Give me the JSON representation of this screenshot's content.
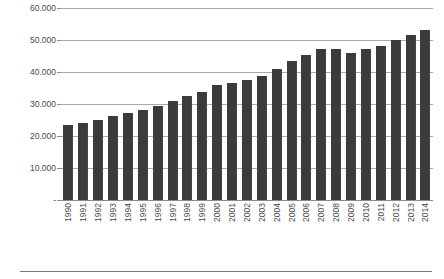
{
  "chart_data": {
    "type": "bar",
    "title": "",
    "subtitle": "",
    "xlabel": "",
    "ylabel": "em US$",
    "ylim": [
      0,
      60000
    ],
    "ytick_labels": [
      "60.000",
      "50.000",
      "40.000",
      "30.000",
      "20.000",
      "10.000",
      "-"
    ],
    "ytick_values": [
      60000,
      50000,
      40000,
      30000,
      20000,
      10000,
      0
    ],
    "grid": true,
    "legend": "none",
    "bar_color": "#3b3b3b",
    "categories": [
      "1990",
      "1991",
      "1992",
      "1993",
      "1994",
      "1995",
      "1996",
      "1997",
      "1998",
      "1999",
      "2000",
      "2001",
      "2002",
      "2003",
      "2004",
      "2005",
      "2006",
      "2007",
      "2008",
      "2009",
      "2010",
      "2011",
      "2012",
      "2013",
      "2014"
    ],
    "values": [
      23500,
      24000,
      25100,
      26400,
      27300,
      28100,
      29300,
      31000,
      32400,
      33700,
      35800,
      36500,
      37400,
      38800,
      41000,
      43500,
      45400,
      47200,
      47300,
      45800,
      47300,
      48200,
      50000,
      51700,
      53100
    ]
  },
  "axis": {
    "y_title": "em US$"
  }
}
